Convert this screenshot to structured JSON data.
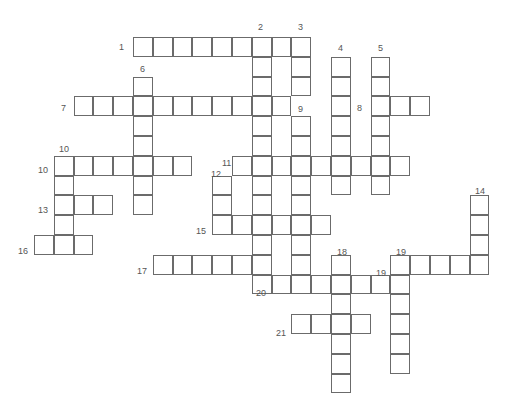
{
  "puzzle": {
    "type": "crossword",
    "grid": {
      "origin_x": 34,
      "origin_y": 37,
      "cell_size": 19.8
    },
    "words": [
      {
        "number": 1,
        "dir": "across",
        "row": 0,
        "col": 5,
        "length": 9
      },
      {
        "number": 2,
        "dir": "down",
        "row": 0,
        "col": 11,
        "length": 13
      },
      {
        "number": 3,
        "dir": "down",
        "row": 0,
        "col": 13,
        "length": 3
      },
      {
        "number": 4,
        "dir": "down",
        "row": 1,
        "col": 15,
        "length": 7
      },
      {
        "number": 5,
        "dir": "down",
        "row": 1,
        "col": 17,
        "length": 7
      },
      {
        "number": 6,
        "dir": "down",
        "row": 2,
        "col": 5,
        "length": 7
      },
      {
        "number": 7,
        "dir": "across",
        "row": 3,
        "col": 2,
        "length": 11
      },
      {
        "number": 8,
        "dir": "across",
        "row": 3,
        "col": 17,
        "length": 3
      },
      {
        "number": 9,
        "dir": "down",
        "row": 4,
        "col": 13,
        "length": 9
      },
      {
        "number": 10,
        "dir": "across",
        "row": 6,
        "col": 1,
        "length": 7
      },
      {
        "number": 10,
        "dir": "down",
        "row": 6,
        "col": 1,
        "length": 5
      },
      {
        "number": 11,
        "dir": "across",
        "row": 6,
        "col": 10,
        "length": 9
      },
      {
        "number": 12,
        "dir": "down",
        "row": 7,
        "col": 9,
        "length": 3
      },
      {
        "number": 13,
        "dir": "across",
        "row": 8,
        "col": 1,
        "length": 3
      },
      {
        "number": 14,
        "dir": "down",
        "row": 8,
        "col": 22,
        "length": 4
      },
      {
        "number": 15,
        "dir": "across",
        "row": 9,
        "col": 9,
        "length": 6
      },
      {
        "number": 16,
        "dir": "across",
        "row": 10,
        "col": 0,
        "length": 3
      },
      {
        "number": 17,
        "dir": "across",
        "row": 11,
        "col": 6,
        "length": 6
      },
      {
        "number": 18,
        "dir": "down",
        "row": 11,
        "col": 15,
        "length": 7
      },
      {
        "number": 19,
        "dir": "across",
        "row": 11,
        "col": 18,
        "length": 5
      },
      {
        "number": 19,
        "dir": "down",
        "row": 11,
        "col": 18,
        "length": 6
      },
      {
        "number": 20,
        "dir": "across",
        "row": 12,
        "col": 11,
        "length": 8
      },
      {
        "number": 21,
        "dir": "across",
        "row": 14,
        "col": 13,
        "length": 4
      }
    ],
    "labels": [
      {
        "text": "1",
        "x": 119,
        "y": 42
      },
      {
        "text": "2",
        "x": 258,
        "y": 22
      },
      {
        "text": "3",
        "x": 298,
        "y": 22
      },
      {
        "text": "4",
        "x": 338,
        "y": 43
      },
      {
        "text": "5",
        "x": 378,
        "y": 43
      },
      {
        "text": "6",
        "x": 140,
        "y": 64
      },
      {
        "text": "7",
        "x": 61,
        "y": 103
      },
      {
        "text": "8",
        "x": 357,
        "y": 103
      },
      {
        "text": "9",
        "x": 298,
        "y": 104
      },
      {
        "text": "10",
        "x": 59,
        "y": 144
      },
      {
        "text": "10",
        "x": 38,
        "y": 165
      },
      {
        "text": "11",
        "x": 222,
        "y": 158
      },
      {
        "text": "12",
        "x": 211,
        "y": 169
      },
      {
        "text": "13",
        "x": 38,
        "y": 205
      },
      {
        "text": "14",
        "x": 475,
        "y": 186
      },
      {
        "text": "15",
        "x": 196,
        "y": 226
      },
      {
        "text": "16",
        "x": 18,
        "y": 246
      },
      {
        "text": "17",
        "x": 137,
        "y": 266
      },
      {
        "text": "18",
        "x": 337,
        "y": 247
      },
      {
        "text": "19",
        "x": 396,
        "y": 247
      },
      {
        "text": "19",
        "x": 376,
        "y": 268
      },
      {
        "text": "20",
        "x": 256,
        "y": 288
      },
      {
        "text": "21",
        "x": 276,
        "y": 328
      }
    ]
  }
}
